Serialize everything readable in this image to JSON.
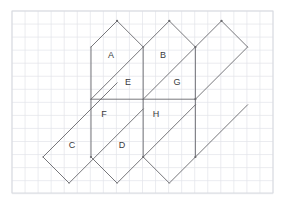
{
  "figure": {
    "background_color": "#ffffff",
    "line_color": "#5f5f63",
    "grid_minor_color": "#e2e4ea",
    "grid_major_color": "#d3d6de"
  },
  "grid": {
    "origin_x": 12,
    "origin_y": 11,
    "cell_size": 13.05,
    "columns": 20,
    "rows": 14,
    "major_every": 0,
    "width": 261,
    "height": 182
  },
  "geometry": {
    "unit": 52.2,
    "half_unit": 26.1,
    "column_x": [
      38.8,
      91.0,
      143.2,
      195.4,
      247.6
    ],
    "row_y": [
      20.9,
      47.0,
      99.2,
      151.4,
      183.0
    ],
    "mid_line_y": 99.2,
    "apex_offset": 26.1
  },
  "faces": [
    {
      "id": "A",
      "label": "A",
      "shape": "pentagon",
      "label_x": 111,
      "label_y": 56,
      "points": "91,99.2 91,47.0 117.1,20.9 143.2,47.0 143.2,47.0"
    },
    {
      "id": "B",
      "label": "B",
      "shape": "pentagon",
      "label_x": 163,
      "label_y": 56,
      "points": "143.2,99.2 143.2,47.0 169.3,20.9 195.4,47.0 195.4,99.2"
    },
    {
      "id": "C",
      "label": "C",
      "shape": "parallelogram",
      "label_x": 72,
      "label_y": 146,
      "points": "43.0,157.0 95.2,104.8 121.3,130.9 69.1,183.1"
    },
    {
      "id": "D",
      "label": "D",
      "shape": "pentagon",
      "label_x": 122,
      "label_y": 146,
      "points": "91,99.2 143.2,99.2 143.2,157.0 117.1,183.1 91,157.0"
    },
    {
      "id": "E",
      "label": "E",
      "shape": "triangle-region",
      "label_x": 128,
      "label_y": 83,
      "points": "91,99.2 143.2,47.0 143.2,99.2"
    },
    {
      "id": "F",
      "label": "F",
      "shape": "triangle-region",
      "label_x": 104,
      "label_y": 115,
      "points": "91,99.2 143.2,99.2 91,151.4"
    },
    {
      "id": "G",
      "label": "G",
      "shape": "triangle-region",
      "label_x": 177,
      "label_y": 83,
      "points": "143.2,99.2 195.4,47.0 195.4,99.2"
    },
    {
      "id": "H",
      "label": "H",
      "shape": "triangle-region",
      "label_x": 156,
      "label_y": 115,
      "points": "143.2,99.2 195.4,99.2 143.2,151.4"
    }
  ],
  "edges": {
    "vertical_segments": [
      {
        "name": "left-vertical",
        "x": 91,
        "y1": 47.0,
        "y2": 157.0
      },
      {
        "name": "middle-vertical",
        "x": 143.2,
        "y1": 47.0,
        "y2": 157.0
      },
      {
        "name": "right-vertical",
        "x": 195.4,
        "y1": 47.0,
        "y2": 157.0
      }
    ],
    "horizontal_segments": [
      {
        "name": "center-horizontal",
        "y": 99.2,
        "x1": 91,
        "x2": 195.4
      }
    ],
    "diagonal_up_segments": [
      {
        "name": "diagonal-c-left",
        "x1": 43.0,
        "y1": 157.0,
        "x2": 117.1,
        "y2": 82.9
      },
      {
        "name": "diagonal-c-right",
        "x1": 69.1,
        "y1": 183.1,
        "x2": 143.2,
        "y2": 109.0
      },
      {
        "name": "diagonal-e",
        "x1": 91.0,
        "y1": 99.2,
        "x2": 143.2,
        "y2": 47.0
      },
      {
        "name": "diagonal-g",
        "x1": 143.2,
        "y1": 99.2,
        "x2": 195.4,
        "y2": 47.0
      },
      {
        "name": "diagonal-d",
        "x1": 117.1,
        "y1": 183.1,
        "x2": 195.4,
        "y2": 104.8
      },
      {
        "name": "diagonal-far-right",
        "x1": 169.3,
        "y1": 183.1,
        "x2": 247.6,
        "y2": 104.8
      }
    ],
    "apex_segments": [
      {
        "name": "apex-a-left",
        "x1": 91.0,
        "y1": 47.0,
        "x2": 117.1,
        "y2": 20.9
      },
      {
        "name": "apex-a-right",
        "x1": 117.1,
        "y1": 20.9,
        "x2": 143.2,
        "y2": 47.0
      },
      {
        "name": "apex-b-left",
        "x1": 143.2,
        "y1": 47.0,
        "x2": 169.3,
        "y2": 20.9
      },
      {
        "name": "apex-b-right",
        "x1": 169.3,
        "y1": 20.9,
        "x2": 195.4,
        "y2": 47.0
      },
      {
        "name": "apex-right-left",
        "x1": 195.4,
        "y1": 47.0,
        "x2": 221.5,
        "y2": 20.9
      },
      {
        "name": "apex-right-right",
        "x1": 221.5,
        "y1": 20.9,
        "x2": 247.6,
        "y2": 47.0
      },
      {
        "name": "bottom-d-left",
        "x1": 91.0,
        "y1": 157.0,
        "x2": 117.1,
        "y2": 183.1
      },
      {
        "name": "bottom-h-left",
        "x1": 143.2,
        "y1": 157.0,
        "x2": 169.3,
        "y2": 183.1
      },
      {
        "name": "bottom-c-left",
        "x1": 43.0,
        "y1": 157.0,
        "x2": 69.1,
        "y2": 183.1
      },
      {
        "name": "right-edge-down",
        "x1": 247.6,
        "y1": 47.0,
        "x2": 195.4,
        "y2": 99.2
      }
    ]
  },
  "vertices": [
    {
      "name": "apex-a",
      "x": 117.1,
      "y": 20.9
    },
    {
      "name": "apex-b",
      "x": 169.3,
      "y": 20.9
    },
    {
      "name": "apex-far-right",
      "x": 221.5,
      "y": 20.9
    },
    {
      "name": "junction-right-upper",
      "x": 195.4,
      "y": 47.0
    },
    {
      "name": "junction-right-mid",
      "x": 195.4,
      "y": 99.2
    },
    {
      "name": "junction-right-lower",
      "x": 195.4,
      "y": 157.0
    },
    {
      "name": "junction-left-lower",
      "x": 91.0,
      "y": 157.0
    },
    {
      "name": "junction-mid-lower",
      "x": 143.2,
      "y": 157.0
    }
  ],
  "labels_visible": [
    "A",
    "B",
    "C",
    "D",
    "E",
    "F",
    "G",
    "H"
  ]
}
